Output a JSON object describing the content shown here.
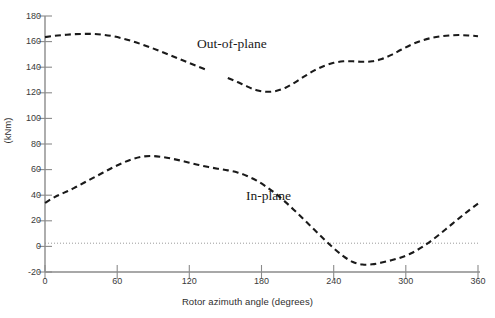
{
  "chart_data": {
    "type": "line",
    "title": "",
    "xlabel": "Rotor azimuth angle (degrees)",
    "ylabel": "(kNm)",
    "xlim": [
      0,
      360
    ],
    "ylim": [
      -20,
      180
    ],
    "xticks": [
      0,
      60,
      120,
      180,
      240,
      300,
      360
    ],
    "yticks": [
      -20,
      0,
      20,
      40,
      60,
      80,
      100,
      120,
      140,
      160,
      180
    ],
    "grid": false,
    "zero_line": true,
    "legend_position": "inline-annotation",
    "line_style": "dashed",
    "line_color": "#1a1a1a",
    "series": [
      {
        "name": "Out-of-plane",
        "annotation": "Out-of-plane",
        "x": [
          0,
          8,
          16,
          24,
          32,
          40,
          48,
          56,
          64,
          72,
          80,
          88,
          96,
          104,
          112,
          120,
          128,
          136,
          144,
          152,
          160,
          168,
          176,
          184,
          192,
          200,
          208,
          216,
          224,
          232,
          240,
          248,
          256,
          264,
          272,
          280,
          288,
          296,
          304,
          312,
          320,
          328,
          336,
          344,
          352,
          360
        ],
        "values": [
          163.5,
          164.5,
          165.2,
          165.8,
          166.0,
          166.0,
          165.4,
          164.3,
          162.6,
          160.5,
          158.0,
          155.3,
          152.4,
          149.4,
          146.3,
          143.2,
          140.2,
          137.3,
          134.5,
          131.6,
          128.4,
          125.0,
          122.0,
          120.8,
          121.4,
          124.0,
          128.2,
          133.0,
          137.5,
          141.0,
          143.4,
          144.6,
          144.6,
          144.2,
          144.6,
          146.4,
          149.6,
          153.6,
          157.4,
          160.4,
          162.6,
          164.0,
          164.8,
          165.1,
          164.8,
          164.2
        ],
        "gap_x": [
          136,
          152
        ],
        "notes": "Upper dashed curve; peak ~166 kNm near 36 deg, minimum ~121 kNm near 184 deg, local plateau ~144 kNm near 256-272 deg, returns to ~164 kNm at 360 deg"
      },
      {
        "name": "In-plane",
        "annotation": "In-plane",
        "x": [
          0,
          8,
          16,
          24,
          32,
          40,
          48,
          56,
          64,
          72,
          80,
          88,
          96,
          104,
          112,
          120,
          128,
          136,
          144,
          152,
          160,
          168,
          176,
          184,
          192,
          200,
          208,
          216,
          224,
          232,
          240,
          248,
          256,
          264,
          272,
          280,
          288,
          296,
          304,
          312,
          320,
          328,
          336,
          344,
          352,
          360
        ],
        "values": [
          34.0,
          38.5,
          42.0,
          45.5,
          49.5,
          53.5,
          57.5,
          61.5,
          65.0,
          68.0,
          70.0,
          70.6,
          70.0,
          68.8,
          67.2,
          65.4,
          63.6,
          62.0,
          60.6,
          59.4,
          57.8,
          55.0,
          51.4,
          46.6,
          41.0,
          34.6,
          27.6,
          20.4,
          13.0,
          5.6,
          -1.4,
          -7.6,
          -12.2,
          -14.2,
          -14.0,
          -12.6,
          -10.8,
          -8.6,
          -5.6,
          -1.4,
          3.6,
          9.4,
          15.6,
          21.8,
          27.8,
          33.4
        ],
        "notes": "Lower dashed curve; starts ~34 kNm, peak ~70.6 kNm near 88 deg, crosses zero near 238 deg, minimum ~-14 kNm near 264 deg, crosses zero again near 314 deg, ends ~33 kNm"
      }
    ]
  }
}
